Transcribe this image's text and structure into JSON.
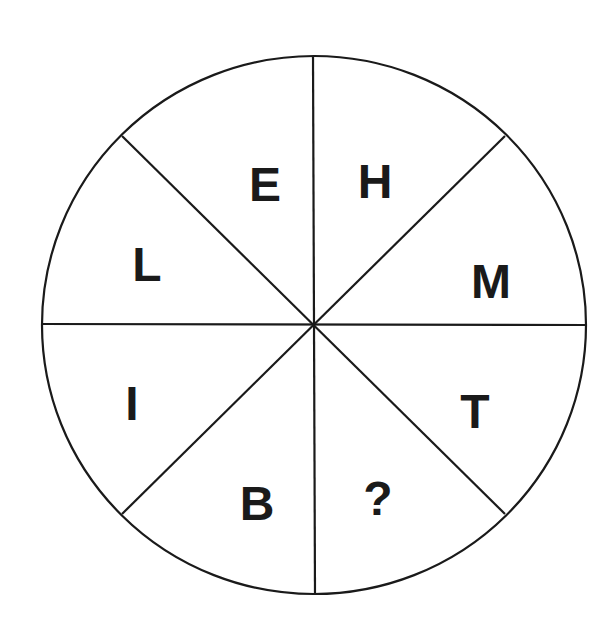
{
  "diagram": {
    "type": "letter-wheel-puzzle",
    "center": [
      314,
      325
    ],
    "radius_x": 272,
    "radius_y": 269,
    "line_color": "#1a1a1a",
    "segments": [
      {
        "position": "upper-left-top",
        "letter": "E",
        "x": 265,
        "y": 201
      },
      {
        "position": "upper-right-top",
        "letter": "H",
        "x": 375,
        "y": 198
      },
      {
        "position": "upper-right-lower",
        "letter": "M",
        "x": 491,
        "y": 298
      },
      {
        "position": "lower-right-upper",
        "letter": "T",
        "x": 475,
        "y": 428
      },
      {
        "position": "lower-right-lower",
        "letter": "?",
        "x": 378,
        "y": 515
      },
      {
        "position": "lower-left-lower",
        "letter": "B",
        "x": 257,
        "y": 520
      },
      {
        "position": "lower-left-upper",
        "letter": "I",
        "x": 132,
        "y": 420
      },
      {
        "position": "upper-left-lower",
        "letter": "L",
        "x": 147,
        "y": 281
      }
    ]
  }
}
